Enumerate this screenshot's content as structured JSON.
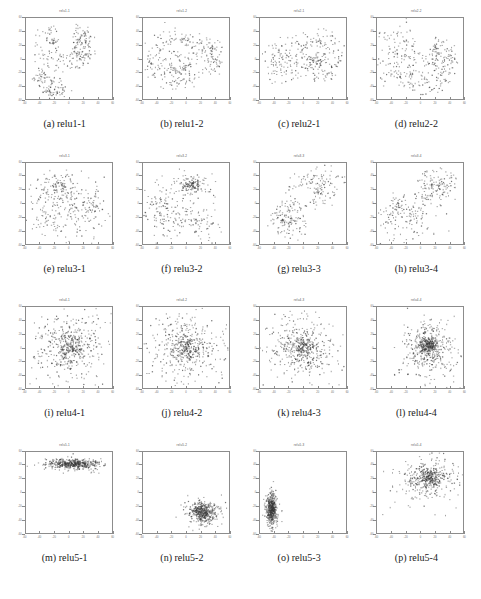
{
  "figure": {
    "title": "",
    "rows": 4,
    "cols": 4,
    "background_color": "#ffffff",
    "axis_color": "#8c8c8c",
    "point_color": "#3a3a3a"
  },
  "chart_data": {
    "type": "scatter",
    "grid": {
      "rows": 4,
      "cols": 4
    },
    "axis": {
      "xlim": [
        -60,
        60
      ],
      "ylim": [
        -60,
        60
      ],
      "xticks": [
        -60,
        -40,
        -20,
        0,
        20,
        40,
        60
      ],
      "yticks": [
        -60,
        -40,
        -20,
        0,
        20,
        40,
        60
      ],
      "xlabel": "",
      "ylabel": "",
      "grid_on": false,
      "legend": "none"
    },
    "panels": [
      {
        "id": "a",
        "caption": "(a) relu1-1",
        "title": "relu1-1",
        "n_points": 330,
        "seed": 11,
        "layout": "rings",
        "clusters": [
          {
            "kind": "arc",
            "cx": -6,
            "cy": 16,
            "r": 34,
            "jitter": 6,
            "a0": 110,
            "a1": 430,
            "n": 120
          },
          {
            "kind": "arc",
            "cx": -2,
            "cy": 18,
            "r": 19,
            "jitter": 5,
            "a0": 140,
            "a1": 400,
            "n": 70
          },
          {
            "kind": "arc",
            "cx": 20,
            "cy": 14,
            "r": 10,
            "jitter": 4,
            "a0": 0,
            "a1": 360,
            "n": 40
          },
          {
            "kind": "arc",
            "cx": -16,
            "cy": -30,
            "r": 24,
            "jitter": 4,
            "a0": 150,
            "a1": 290,
            "n": 55
          },
          {
            "kind": "blob",
            "cx": -30,
            "cy": -33,
            "sx": 8,
            "sy": 5,
            "n": 25
          },
          {
            "kind": "blob",
            "cx": -14,
            "cy": -45,
            "sx": 7,
            "sy": 5,
            "n": 20
          }
        ]
      },
      {
        "id": "b",
        "caption": "(b) relu1-2",
        "title": "relu1-2",
        "n_points": 320,
        "seed": 22,
        "layout": "concentric-rings-plus-cluster",
        "clusters": [
          {
            "kind": "arc",
            "cx": -14,
            "cy": 0,
            "r": 38,
            "jitter": 5,
            "a0": 0,
            "a1": 360,
            "n": 110
          },
          {
            "kind": "arc",
            "cx": -14,
            "cy": 2,
            "r": 26,
            "jitter": 4,
            "a0": 0,
            "a1": 360,
            "n": 80
          },
          {
            "kind": "arc",
            "cx": -12,
            "cy": -4,
            "r": 14,
            "jitter": 4,
            "a0": 0,
            "a1": 360,
            "n": 55
          },
          {
            "kind": "blob",
            "cx": 36,
            "cy": 16,
            "sx": 6,
            "sy": 7,
            "n": 35
          },
          {
            "kind": "blob",
            "cx": 38,
            "cy": -6,
            "sx": 7,
            "sy": 8,
            "n": 40
          }
        ]
      },
      {
        "id": "c",
        "caption": "(c) relu2-1",
        "title": "relu2-1",
        "n_points": 330,
        "seed": 33,
        "layout": "two-groups",
        "clusters": [
          {
            "kind": "blob",
            "cx": -34,
            "cy": -4,
            "sx": 10,
            "sy": 16,
            "n": 85
          },
          {
            "kind": "arc",
            "cx": 18,
            "cy": 4,
            "r": 32,
            "jitter": 6,
            "a0": 0,
            "a1": 360,
            "n": 115
          },
          {
            "kind": "arc",
            "cx": 16,
            "cy": 6,
            "r": 18,
            "jitter": 4,
            "a0": 0,
            "a1": 360,
            "n": 75
          },
          {
            "kind": "arc",
            "cx": 14,
            "cy": 4,
            "r": 8,
            "jitter": 3,
            "a0": 180,
            "a1": 400,
            "n": 35
          }
        ]
      },
      {
        "id": "d",
        "caption": "(d) relu2-2",
        "title": "relu2-2",
        "n_points": 340,
        "seed": 44,
        "layout": "spiral",
        "clusters": [
          {
            "kind": "arc",
            "cx": 6,
            "cy": -6,
            "r": 40,
            "jitter": 5,
            "a0": 200,
            "a1": 430,
            "n": 95
          },
          {
            "kind": "arc",
            "cx": 6,
            "cy": -2,
            "r": 27,
            "jitter": 5,
            "a0": 190,
            "a1": 420,
            "n": 70
          },
          {
            "kind": "arc",
            "cx": 10,
            "cy": 6,
            "r": 14,
            "jitter": 4,
            "a0": 160,
            "a1": 430,
            "n": 45
          },
          {
            "kind": "blob",
            "cx": -28,
            "cy": 20,
            "sx": 16,
            "sy": 18,
            "n": 70
          },
          {
            "kind": "blob",
            "cx": -34,
            "cy": -16,
            "sx": 12,
            "sy": 14,
            "n": 45
          }
        ]
      },
      {
        "id": "e",
        "caption": "(e) relu3-1",
        "title": "relu3-1",
        "n_points": 360,
        "seed": 55,
        "layout": "small-ring-plus-scatter",
        "clusters": [
          {
            "kind": "arc",
            "cx": -14,
            "cy": 24,
            "r": 7,
            "jitter": 1.5,
            "a0": 0,
            "a1": 360,
            "n": 45
          },
          {
            "kind": "arc",
            "cx": -14,
            "cy": 24,
            "r": 20,
            "jitter": 4,
            "a0": 0,
            "a1": 360,
            "n": 55
          },
          {
            "kind": "blob",
            "cx": -8,
            "cy": 8,
            "sx": 26,
            "sy": 18,
            "n": 90
          },
          {
            "kind": "blob",
            "cx": 6,
            "cy": -22,
            "sx": 26,
            "sy": 18,
            "n": 100
          },
          {
            "kind": "blob",
            "cx": 34,
            "cy": 2,
            "sx": 10,
            "sy": 16,
            "n": 40
          },
          {
            "kind": "blob",
            "cx": -32,
            "cy": -24,
            "sx": 10,
            "sy": 14,
            "n": 30
          }
        ]
      },
      {
        "id": "f",
        "caption": "(f) relu3-2",
        "title": "relu3-2",
        "n_points": 370,
        "seed": 66,
        "layout": "dense-blob-plus-diagonal",
        "clusters": [
          {
            "kind": "blob",
            "cx": 6,
            "cy": 27,
            "sx": 6,
            "sy": 4,
            "n": 70
          },
          {
            "kind": "arc",
            "cx": 6,
            "cy": 27,
            "r": 12,
            "jitter": 3,
            "a0": 0,
            "a1": 360,
            "n": 40
          },
          {
            "kind": "blob",
            "cx": 4,
            "cy": 22,
            "sx": 24,
            "sy": 12,
            "n": 60
          },
          {
            "kind": "blob",
            "cx": -10,
            "cy": -14,
            "sx": 26,
            "sy": 20,
            "n": 120
          },
          {
            "kind": "blob",
            "cx": -36,
            "cy": -6,
            "sx": 9,
            "sy": 12,
            "n": 40
          },
          {
            "kind": "blob",
            "cx": 22,
            "cy": -28,
            "sx": 14,
            "sy": 12,
            "n": 40
          }
        ]
      },
      {
        "id": "g",
        "caption": "(g) relu3-3",
        "title": "relu3-3",
        "n_points": 330,
        "seed": 77,
        "layout": "two-clusters-diagonal",
        "clusters": [
          {
            "kind": "blob",
            "cx": 22,
            "cy": 26,
            "sx": 18,
            "sy": 14,
            "n": 140
          },
          {
            "kind": "arc",
            "cx": -22,
            "cy": -24,
            "r": 6,
            "jitter": 1.5,
            "a0": 0,
            "a1": 360,
            "n": 30
          },
          {
            "kind": "arc",
            "cx": -20,
            "cy": -22,
            "r": 14,
            "jitter": 3,
            "a0": 0,
            "a1": 360,
            "n": 45
          },
          {
            "kind": "arc",
            "cx": -20,
            "cy": -22,
            "r": 24,
            "jitter": 4,
            "a0": 0,
            "a1": 360,
            "n": 60
          }
        ]
      },
      {
        "id": "h",
        "caption": "(h) relu3-4",
        "title": "relu3-4",
        "n_points": 330,
        "seed": 88,
        "layout": "ring-plus-cluster",
        "clusters": [
          {
            "kind": "arc",
            "cx": 22,
            "cy": 24,
            "r": 6,
            "jitter": 1.2,
            "a0": 0,
            "a1": 360,
            "n": 28
          },
          {
            "kind": "arc",
            "cx": 22,
            "cy": 24,
            "r": 14,
            "jitter": 2.5,
            "a0": 0,
            "a1": 360,
            "n": 45
          },
          {
            "kind": "arc",
            "cx": 22,
            "cy": 24,
            "r": 24,
            "jitter": 4,
            "a0": 0,
            "a1": 360,
            "n": 60
          },
          {
            "kind": "blob",
            "cx": -18,
            "cy": -20,
            "sx": 20,
            "sy": 18,
            "n": 130
          },
          {
            "kind": "blob",
            "cx": -34,
            "cy": -4,
            "sx": 8,
            "sy": 10,
            "n": 30
          }
        ]
      },
      {
        "id": "i",
        "caption": "(i) relu4-1",
        "title": "relu4-1",
        "n_points": 520,
        "seed": 99,
        "layout": "gaussian-cloud",
        "clusters": [
          {
            "kind": "blob",
            "cx": 2,
            "cy": -2,
            "sx": 9,
            "sy": 9,
            "n": 130
          },
          {
            "kind": "blob",
            "cx": 0,
            "cy": 0,
            "sx": 22,
            "sy": 22,
            "n": 250
          },
          {
            "kind": "blob",
            "cx": -2,
            "cy": 0,
            "sx": 34,
            "sy": 32,
            "n": 140
          }
        ]
      },
      {
        "id": "j",
        "caption": "(j) relu4-2",
        "title": "relu4-2",
        "n_points": 520,
        "seed": 101,
        "layout": "gaussian-cloud",
        "clusters": [
          {
            "kind": "blob",
            "cx": 0,
            "cy": -2,
            "sx": 8,
            "sy": 8,
            "n": 120
          },
          {
            "kind": "blob",
            "cx": 0,
            "cy": 0,
            "sx": 22,
            "sy": 22,
            "n": 250
          },
          {
            "kind": "blob",
            "cx": 0,
            "cy": 2,
            "sx": 34,
            "sy": 34,
            "n": 150
          }
        ]
      },
      {
        "id": "k",
        "caption": "(k) relu4-3",
        "title": "relu4-3",
        "n_points": 500,
        "seed": 111,
        "layout": "gaussian-cloud",
        "clusters": [
          {
            "kind": "blob",
            "cx": 0,
            "cy": 0,
            "sx": 8,
            "sy": 8,
            "n": 120
          },
          {
            "kind": "blob",
            "cx": -2,
            "cy": 0,
            "sx": 21,
            "sy": 21,
            "n": 240
          },
          {
            "kind": "blob",
            "cx": 0,
            "cy": 0,
            "sx": 33,
            "sy": 31,
            "n": 140
          }
        ]
      },
      {
        "id": "l",
        "caption": "(l) relu4-4",
        "title": "relu4-4",
        "n_points": 620,
        "seed": 121,
        "layout": "dense-gaussian-cloud",
        "clusters": [
          {
            "kind": "blob",
            "cx": 12,
            "cy": 4,
            "sx": 6,
            "sy": 6,
            "n": 180
          },
          {
            "kind": "blob",
            "cx": 12,
            "cy": 0,
            "sx": 15,
            "sy": 18,
            "n": 290
          },
          {
            "kind": "blob",
            "cx": 12,
            "cy": -6,
            "sx": 22,
            "sy": 26,
            "n": 150
          }
        ]
      },
      {
        "id": "m",
        "caption": "(m) relu5-1",
        "title": "relu5-1",
        "n_points": 480,
        "seed": 131,
        "layout": "horizontal-band",
        "clusters": [
          {
            "kind": "blob",
            "cx": 6,
            "cy": 42,
            "sx": 16,
            "sy": 3,
            "n": 300
          },
          {
            "kind": "blob",
            "cx": 6,
            "cy": 42,
            "sx": 22,
            "sy": 5,
            "n": 180
          }
        ]
      },
      {
        "id": "n",
        "caption": "(n) relu5-2",
        "title": "relu5-2",
        "n_points": 470,
        "seed": 141,
        "layout": "compact-blob",
        "clusters": [
          {
            "kind": "blob",
            "cx": 24,
            "cy": -30,
            "sx": 8,
            "sy": 6,
            "n": 290
          },
          {
            "kind": "blob",
            "cx": 24,
            "cy": -30,
            "sx": 14,
            "sy": 10,
            "n": 180
          }
        ]
      },
      {
        "id": "o",
        "caption": "(o) relu5-3",
        "title": "relu5-3",
        "n_points": 470,
        "seed": 151,
        "layout": "vertical-blob",
        "clusters": [
          {
            "kind": "blob",
            "cx": -44,
            "cy": -24,
            "sx": 3,
            "sy": 10,
            "n": 300
          },
          {
            "kind": "blob",
            "cx": -44,
            "cy": -24,
            "sx": 5,
            "sy": 15,
            "n": 170
          }
        ]
      },
      {
        "id": "p",
        "caption": "(p) relu5-4",
        "title": "relu5-4",
        "n_points": 470,
        "seed": 161,
        "layout": "diffuse-cloud",
        "clusters": [
          {
            "kind": "blob",
            "cx": 14,
            "cy": 22,
            "sx": 8,
            "sy": 7,
            "n": 150
          },
          {
            "kind": "blob",
            "cx": 12,
            "cy": 20,
            "sx": 18,
            "sy": 14,
            "n": 220
          },
          {
            "kind": "blob",
            "cx": 10,
            "cy": 18,
            "sx": 28,
            "sy": 20,
            "n": 100
          }
        ]
      }
    ]
  }
}
